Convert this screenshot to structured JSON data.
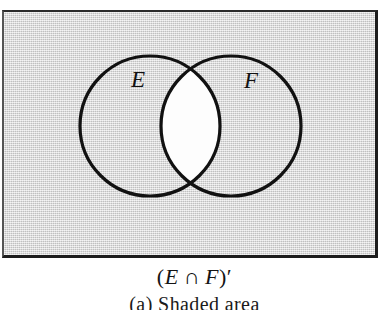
{
  "figure": {
    "kind": "venn-diagram",
    "universe": {
      "name": "universal-set-rectangle",
      "fill_color": "#d6d6d6",
      "border_color": "#1c1c1c",
      "shaded": true
    },
    "sets": [
      {
        "id": "E",
        "label": "E",
        "cx": 150,
        "cy": 126,
        "r": 70,
        "stroke_color": "#111111",
        "filled": false
      },
      {
        "id": "F",
        "label": "F",
        "cx": 231,
        "cy": 126,
        "r": 70,
        "stroke_color": "#111111",
        "filled": false
      }
    ],
    "intersection": {
      "name": "intersection-lens",
      "shaded": false,
      "fill_color": "#fdfdfd"
    },
    "shading_description": "Everything inside the rectangle is shaded gray except the lens-shaped overlap of the two circles, which is white."
  },
  "caption": {
    "formula": {
      "open_paren": "(",
      "left_set": "E",
      "operator": "∩",
      "right_set": "F",
      "close_paren": ")",
      "prime": "′",
      "plain_text": "(E ∩ F)′"
    },
    "subcaption": "(a)  Shaded area"
  }
}
